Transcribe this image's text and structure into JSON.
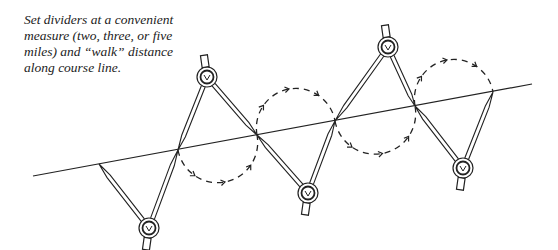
{
  "caption": {
    "lines": [
      "Set dividers at a convenient",
      "measure (two, three, or five",
      "miles) and “walk” distance",
      "along course line."
    ]
  },
  "diagram": {
    "course_line": {
      "x1": 33,
      "y1": 176,
      "x2": 532,
      "y2": 84
    },
    "stroke_color": "#222222",
    "divider_positions": [
      {
        "pivot": [
          149,
          228
        ],
        "legs": [
          [
            99,
            164
          ],
          [
            178,
            150
          ]
        ],
        "orientation": "down"
      },
      {
        "pivot": [
          207,
          77
        ],
        "legs": [
          [
            178,
            150
          ],
          [
            257,
            135
          ]
        ],
        "orientation": "up"
      },
      {
        "pivot": [
          308,
          193
        ],
        "legs": [
          [
            257,
            135
          ],
          [
            335,
            121
          ]
        ],
        "orientation": "down"
      },
      {
        "pivot": [
          388,
          47
        ],
        "legs": [
          [
            335,
            121
          ],
          [
            415,
            106
          ]
        ],
        "orientation": "up"
      },
      {
        "pivot": [
          463,
          168
        ],
        "legs": [
          [
            415,
            106
          ],
          [
            493,
            92
          ]
        ],
        "orientation": "down"
      }
    ],
    "walk_arcs": [
      {
        "from": [
          178,
          150
        ],
        "to": [
          257,
          135
        ],
        "side": "below"
      },
      {
        "from": [
          257,
          135
        ],
        "to": [
          335,
          121
        ],
        "side": "above"
      },
      {
        "from": [
          335,
          121
        ],
        "to": [
          415,
          106
        ],
        "side": "below"
      },
      {
        "from": [
          415,
          106
        ],
        "to": [
          493,
          92
        ],
        "side": "above"
      }
    ]
  }
}
